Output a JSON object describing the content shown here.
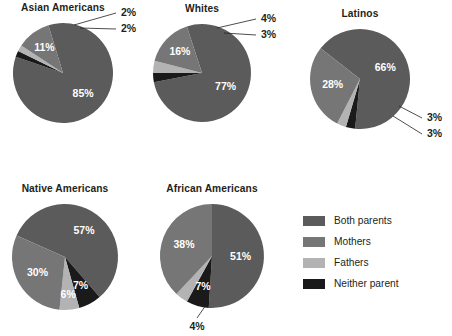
{
  "chart_data": {
    "type": "pie",
    "title": "",
    "legend": {
      "position": "bottom-right",
      "entries": [
        {
          "label": "Both parents",
          "color": "#5b5b5b"
        },
        {
          "label": "Mothers",
          "color": "#767676"
        },
        {
          "label": "Fathers",
          "color": "#b3b3b3"
        },
        {
          "label": "Neither parent",
          "color": "#1a1a1a"
        }
      ]
    },
    "categories": [
      "Both parents",
      "Mothers",
      "Fathers",
      "Neither parent"
    ],
    "unit": "%",
    "charts": [
      {
        "title": "Asian Americans",
        "cx": 63,
        "cy": 73,
        "r": 50,
        "start_angle": -17,
        "values": [
          85,
          11,
          2,
          2
        ],
        "labels": [
          "85%",
          "11%",
          "2%",
          "2%"
        ],
        "label_modes": [
          "inside",
          "inside",
          "outside",
          "outside"
        ],
        "label_radius": [
          0.58,
          0.62,
          1.0,
          1.0
        ],
        "outside_points": [
          null,
          null,
          {
            "text_x": 121,
            "text_y": 13,
            "elbow_x": 116,
            "elbow_y": 13,
            "tip_x": 74,
            "tip_y": 25
          },
          {
            "text_x": 121,
            "text_y": 29,
            "elbow_x": 116,
            "elbow_y": 29,
            "tip_x": 80,
            "tip_y": 28
          }
        ]
      },
      {
        "title": "Whites",
        "cx": 202,
        "cy": 73,
        "r": 49,
        "start_angle": -18,
        "values": [
          77,
          16,
          4,
          3
        ],
        "labels": [
          "77%",
          "16%",
          "4%",
          "3%"
        ],
        "label_modes": [
          "inside",
          "inside",
          "outside",
          "outside"
        ],
        "label_radius": [
          0.56,
          0.62,
          1.0,
          1.0
        ],
        "outside_points": [
          null,
          null,
          {
            "text_x": 261,
            "text_y": 19,
            "elbow_x": 256,
            "elbow_y": 19,
            "tip_x": 217,
            "tip_y": 28
          },
          {
            "text_x": 261,
            "text_y": 35,
            "elbow_x": 256,
            "elbow_y": 35,
            "tip_x": 224,
            "tip_y": 33
          }
        ]
      },
      {
        "title": "Latinos",
        "cx": 360,
        "cy": 79,
        "r": 50,
        "start_angle": -52,
        "values": [
          66,
          28,
          3,
          3
        ],
        "labels": [
          "66%",
          "28%",
          "3%",
          "3%"
        ],
        "label_modes": [
          "inside",
          "inside",
          "outside",
          "outside"
        ],
        "label_radius": [
          0.55,
          0.56,
          1.0,
          1.0
        ],
        "outside_points": [
          null,
          null,
          {
            "text_x": 427,
            "text_y": 118,
            "elbow_x": 422,
            "elbow_y": 118,
            "tip_x": 399,
            "tip_y": 106
          },
          {
            "text_x": 427,
            "text_y": 134,
            "elbow_x": 422,
            "elbow_y": 134,
            "tip_x": 393,
            "tip_y": 116
          }
        ]
      },
      {
        "title": "Native Americans",
        "cx": 65,
        "cy": 257,
        "r": 53,
        "start_angle": -66,
        "values": [
          57,
          30,
          6,
          7
        ],
        "labels": [
          "57%",
          "30%",
          "6%",
          "7%"
        ],
        "label_modes": [
          "inside",
          "inside",
          "inside",
          "inside"
        ],
        "label_radius": [
          0.6,
          0.6,
          0.72,
          0.62
        ],
        "outside_points": [
          null,
          null,
          null,
          null
        ]
      },
      {
        "title": "African Americans",
        "cx": 212,
        "cy": 256,
        "r": 52,
        "start_angle": 0,
        "values": [
          51,
          38,
          4,
          7
        ],
        "labels": [
          "51%",
          "38%",
          "4%",
          "7%"
        ],
        "label_modes": [
          "inside",
          "inside",
          "outside",
          "inside"
        ],
        "label_radius": [
          0.55,
          0.58,
          1.0,
          0.62
        ],
        "outside_points": [
          null,
          null,
          {
            "text_x": 197,
            "text_y": 327,
            "elbow_x": 197,
            "elbow_y": 327,
            "tip_x": 206,
            "tip_y": 305
          },
          null
        ]
      }
    ]
  },
  "slice_order_note": "Both parents, Neither parent, Fathers, Mothers drawn clockwise per chart",
  "colors": {
    "both_parents": "#5b5b5b",
    "mothers": "#767676",
    "fathers": "#b3b3b3",
    "neither_parent": "#1a1a1a",
    "background": "#ffffff",
    "text": "#231f20"
  }
}
